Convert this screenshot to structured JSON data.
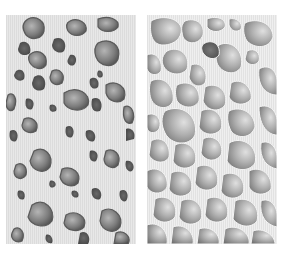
{
  "figure": {
    "panels": [
      {
        "id": "left",
        "subject": "dense-bone-structure",
        "background": "#e6e6e6",
        "pore_dark": "#5a5a5a",
        "pore_light": "#9a9a9a"
      },
      {
        "id": "right",
        "subject": "porous-bone-structure",
        "background": "#ececec",
        "cavity_dark": "#7a7a7a",
        "cavity_light": "#d8d8d8"
      }
    ],
    "page_background": "#ffffff"
  }
}
